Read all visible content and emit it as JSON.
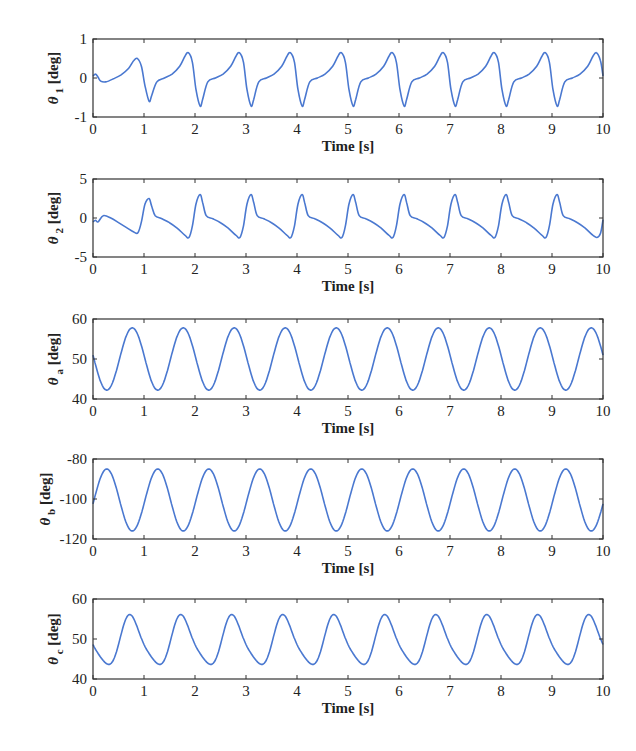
{
  "figure": {
    "line_color": "#4a78d0",
    "axes_color": "#333333"
  },
  "chart_data": [
    {
      "type": "line",
      "title": "",
      "xlabel": "Time [s]",
      "ylabel": "θ1 [deg]",
      "ylabel_symbol": "θ",
      "ylabel_sub": "1",
      "ylabel_unit": "[deg]",
      "xlim": [
        0,
        10
      ],
      "ylim": [
        -1,
        1
      ],
      "xticks": [
        0,
        1,
        2,
        3,
        4,
        5,
        6,
        7,
        8,
        9,
        10
      ],
      "yticks": [
        -1,
        0,
        1
      ],
      "grid": false,
      "series": [
        {
          "name": "theta_1",
          "x": [
            0,
            0.05,
            0.1,
            0.15,
            0.25,
            0.4,
            0.55,
            0.7,
            0.8,
            0.87,
            0.95,
            1.02,
            1.1,
            1.15,
            1.25,
            1.4,
            1.55,
            1.7,
            1.8,
            1.87,
            1.95,
            2.02,
            2.1,
            2.15,
            2.25,
            2.4,
            2.55,
            2.7,
            2.8,
            2.87,
            2.95,
            3.02,
            3.1,
            3.15,
            3.25,
            3.4,
            3.55,
            3.7,
            3.8,
            3.87,
            3.95,
            4.02,
            4.1,
            4.15,
            4.25,
            4.4,
            4.55,
            4.7,
            4.8,
            4.87,
            4.95,
            5.02,
            5.1,
            5.15,
            5.25,
            5.4,
            5.55,
            5.7,
            5.8,
            5.87,
            5.95,
            6.02,
            6.1,
            6.15,
            6.25,
            6.4,
            6.55,
            6.7,
            6.8,
            6.87,
            6.95,
            7.02,
            7.1,
            7.15,
            7.25,
            7.4,
            7.55,
            7.7,
            7.8,
            7.87,
            7.95,
            8.02,
            8.1,
            8.15,
            8.25,
            8.4,
            8.55,
            8.7,
            8.8,
            8.87,
            8.95,
            9.02,
            9.1,
            9.15,
            9.25,
            9.4,
            9.55,
            9.7,
            9.8,
            9.87,
            9.95,
            10
          ],
          "y": [
            0.05,
            0.1,
            0.02,
            -0.08,
            -0.1,
            -0.02,
            0.08,
            0.25,
            0.45,
            0.5,
            0.3,
            -0.2,
            -0.6,
            -0.45,
            -0.1,
            0.0,
            0.1,
            0.3,
            0.55,
            0.65,
            0.4,
            -0.3,
            -0.72,
            -0.55,
            -0.1,
            0.0,
            0.1,
            0.3,
            0.55,
            0.65,
            0.4,
            -0.3,
            -0.72,
            -0.55,
            -0.1,
            0.0,
            0.1,
            0.3,
            0.55,
            0.65,
            0.4,
            -0.3,
            -0.72,
            -0.55,
            -0.1,
            0.0,
            0.1,
            0.3,
            0.55,
            0.65,
            0.4,
            -0.3,
            -0.72,
            -0.55,
            -0.1,
            0.0,
            0.1,
            0.3,
            0.55,
            0.65,
            0.4,
            -0.3,
            -0.72,
            -0.55,
            -0.1,
            0.0,
            0.1,
            0.3,
            0.55,
            0.65,
            0.4,
            -0.3,
            -0.72,
            -0.55,
            -0.1,
            0.0,
            0.1,
            0.3,
            0.55,
            0.65,
            0.4,
            -0.3,
            -0.72,
            -0.55,
            -0.1,
            0.0,
            0.1,
            0.3,
            0.55,
            0.65,
            0.4,
            -0.3,
            -0.72,
            -0.55,
            -0.1,
            0.0,
            0.1,
            0.3,
            0.55,
            0.65,
            0.45,
            0.05
          ]
        }
      ]
    },
    {
      "type": "line",
      "title": "",
      "xlabel": "Time [s]",
      "ylabel": "θ2 [deg]",
      "ylabel_symbol": "θ",
      "ylabel_sub": "2",
      "ylabel_unit": "[deg]",
      "xlim": [
        0,
        10
      ],
      "ylim": [
        -5,
        5
      ],
      "xticks": [
        0,
        1,
        2,
        3,
        4,
        5,
        6,
        7,
        8,
        9,
        10
      ],
      "yticks": [
        -5,
        0,
        5
      ],
      "grid": false,
      "series": [
        {
          "name": "theta_2",
          "x": [
            0,
            0.05,
            0.1,
            0.2,
            0.35,
            0.5,
            0.65,
            0.8,
            0.88,
            0.95,
            1.02,
            1.1,
            1.15,
            1.22,
            1.35,
            1.5,
            1.65,
            1.8,
            1.88,
            1.95,
            2.02,
            2.1,
            2.15,
            2.22,
            2.35,
            2.5,
            2.65,
            2.8,
            2.88,
            2.95,
            3.02,
            3.1,
            3.15,
            3.22,
            3.35,
            3.5,
            3.65,
            3.8,
            3.88,
            3.95,
            4.02,
            4.1,
            4.15,
            4.22,
            4.35,
            4.5,
            4.65,
            4.8,
            4.88,
            4.95,
            5.02,
            5.1,
            5.15,
            5.22,
            5.35,
            5.5,
            5.65,
            5.8,
            5.88,
            5.95,
            6.02,
            6.1,
            6.15,
            6.22,
            6.35,
            6.5,
            6.65,
            6.8,
            6.88,
            6.95,
            7.02,
            7.1,
            7.15,
            7.22,
            7.35,
            7.5,
            7.65,
            7.8,
            7.88,
            7.95,
            8.02,
            8.1,
            8.15,
            8.22,
            8.35,
            8.5,
            8.65,
            8.8,
            8.88,
            8.95,
            9.02,
            9.1,
            9.15,
            9.22,
            9.35,
            9.5,
            9.65,
            9.8,
            9.88,
            9.95,
            10
          ],
          "y": [
            -0.5,
            -0.3,
            -0.5,
            0.3,
            0.0,
            -0.6,
            -1.2,
            -1.8,
            -1.9,
            -0.5,
            1.8,
            2.5,
            1.5,
            0.3,
            -0.1,
            -0.6,
            -1.3,
            -2.2,
            -2.5,
            -1.0,
            1.8,
            3.0,
            2.0,
            0.3,
            -0.1,
            -0.6,
            -1.3,
            -2.2,
            -2.5,
            -1.0,
            1.8,
            3.0,
            2.0,
            0.3,
            -0.1,
            -0.6,
            -1.3,
            -2.2,
            -2.5,
            -1.0,
            1.8,
            3.0,
            2.0,
            0.3,
            -0.1,
            -0.6,
            -1.3,
            -2.2,
            -2.5,
            -1.0,
            1.8,
            3.0,
            2.0,
            0.3,
            -0.1,
            -0.6,
            -1.3,
            -2.2,
            -2.5,
            -1.0,
            1.8,
            3.0,
            2.0,
            0.3,
            -0.1,
            -0.6,
            -1.3,
            -2.2,
            -2.5,
            -1.0,
            1.8,
            3.0,
            2.0,
            0.3,
            -0.1,
            -0.6,
            -1.3,
            -2.2,
            -2.5,
            -1.0,
            1.8,
            3.0,
            2.0,
            0.3,
            -0.1,
            -0.6,
            -1.3,
            -2.2,
            -2.5,
            -1.0,
            1.8,
            3.0,
            2.0,
            0.3,
            -0.1,
            -0.6,
            -1.3,
            -2.2,
            -2.5,
            -2.0,
            -0.2
          ]
        }
      ]
    },
    {
      "type": "line",
      "title": "",
      "xlabel": "Time [s]",
      "ylabel": "θa [deg]",
      "ylabel_symbol": "θ",
      "ylabel_sub": "a",
      "ylabel_unit": "[deg]",
      "xlim": [
        0,
        10
      ],
      "ylim": [
        40,
        60
      ],
      "xticks": [
        0,
        1,
        2,
        3,
        4,
        5,
        6,
        7,
        8,
        9,
        10
      ],
      "yticks": [
        40,
        50,
        60
      ],
      "grid": false,
      "series": [
        {
          "name": "theta_a",
          "waveform": "sine",
          "mean": 50,
          "amplitude": 7.8,
          "period": 1.0,
          "peak_time": 0.77,
          "peaks_approx": 57.8,
          "troughs_approx": 42.2
        }
      ]
    },
    {
      "type": "line",
      "title": "",
      "xlabel": "Time [s]",
      "ylabel": "θb [deg]",
      "ylabel_symbol": "θ",
      "ylabel_sub": "b",
      "ylabel_unit": "[deg]",
      "xlim": [
        0,
        10
      ],
      "ylim": [
        -120,
        -80
      ],
      "xticks": [
        0,
        1,
        2,
        3,
        4,
        5,
        6,
        7,
        8,
        9,
        10
      ],
      "yticks": [
        -120,
        -100,
        -80
      ],
      "grid": false,
      "series": [
        {
          "name": "theta_b",
          "waveform": "sine",
          "mean": -100.5,
          "amplitude": 15.5,
          "period": 1.0,
          "peak_time": 0.27,
          "peaks_approx": -85,
          "troughs_approx": -116
        }
      ]
    },
    {
      "type": "line",
      "title": "",
      "xlabel": "Time [s]",
      "ylabel": "θc [deg]",
      "ylabel_symbol": "θ",
      "ylabel_sub": "c",
      "ylabel_unit": "[deg]",
      "xlim": [
        0,
        10
      ],
      "ylim": [
        40,
        60
      ],
      "xticks": [
        0,
        1,
        2,
        3,
        4,
        5,
        6,
        7,
        8,
        9,
        10
      ],
      "yticks": [
        40,
        50,
        60
      ],
      "grid": false,
      "series": [
        {
          "name": "theta_c",
          "waveform": "sine_with_shoulder",
          "mean": 49.3,
          "amplitude": 6.6,
          "period": 1.0,
          "peak_time": 0.75,
          "shoulder_time": 1.05,
          "shoulder_value": 50,
          "peaks_approx": 55.8,
          "troughs_approx": 42.7
        }
      ]
    }
  ]
}
